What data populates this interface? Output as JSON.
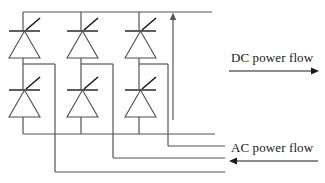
{
  "diagram": {
    "type": "schematic",
    "line_color": "#555555",
    "device_color": "#4d4d4d",
    "gate_color": "#1a1a1a",
    "text_color": "#1a1a1a",
    "background": "#ffffff"
  },
  "labels": {
    "dc_flow": "DC power flow",
    "ac_flow": "AC power flow"
  },
  "arrows": {
    "dc": {
      "direction": "right",
      "x1": 229,
      "x2": 318,
      "y": 71
    },
    "ac": {
      "direction": "left",
      "x1": 318,
      "x2": 229,
      "y": 161
    },
    "dc_current": {
      "direction": "up",
      "x": 173,
      "y1": 120,
      "y2": 14
    }
  },
  "rails": {
    "top": {
      "y": 12,
      "x1": 23,
      "x2": 212
    },
    "bottom": {
      "y": 134,
      "x1": 23,
      "x2": 215
    }
  },
  "columns": [
    {
      "name": "phase-a",
      "x": 23,
      "mid_y": 64,
      "drop_x": 55,
      "ac_line_y": 172
    },
    {
      "name": "phase-b",
      "x": 81,
      "mid_y": 64,
      "drop_x": 113,
      "ac_line_y": 158
    },
    {
      "name": "phase-c",
      "x": 139,
      "mid_y": 64,
      "drop_x": 168,
      "ac_line_y": 146
    }
  ],
  "thyristors": [
    {
      "id": "t1",
      "position": "upper-phase-a",
      "cx": 23,
      "bar_y": 31
    },
    {
      "id": "t3",
      "position": "upper-phase-b",
      "cx": 81,
      "bar_y": 31
    },
    {
      "id": "t5",
      "position": "upper-phase-c",
      "cx": 139,
      "bar_y": 31
    },
    {
      "id": "t4",
      "position": "lower-phase-a",
      "cx": 23,
      "bar_y": 90
    },
    {
      "id": "t6",
      "position": "lower-phase-b",
      "cx": 81,
      "bar_y": 90
    },
    {
      "id": "t2",
      "position": "lower-phase-c",
      "cx": 139,
      "bar_y": 90
    }
  ],
  "ac_lines": [
    {
      "name": "ac-line-phase-c",
      "y": 146,
      "x_end": 225
    },
    {
      "name": "ac-line-phase-b",
      "y": 158,
      "x_end": 225
    },
    {
      "name": "ac-line-phase-a",
      "y": 172,
      "x_end": 225
    }
  ]
}
